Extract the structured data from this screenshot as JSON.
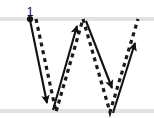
{
  "diagram": {
    "letter": "W",
    "background_color": "#ffffff",
    "guideline_color": "#e2e2e2",
    "stroke_color": "#111111",
    "outline_color": "#1a1a1a",
    "guidelines": [
      {
        "name": "top-guideline",
        "y": 19
      },
      {
        "name": "baseline-guideline",
        "y": 111
      }
    ],
    "start_marker": {
      "label": "1",
      "label_x": 30,
      "label_y": 16,
      "dot_x": 30,
      "dot_y": 19,
      "dot_radius": 3.1
    },
    "strokes": [
      {
        "order": 1,
        "name": "stroke-1-down-right",
        "from_x": 30,
        "from_y": 20,
        "to_x": 47,
        "to_y": 103,
        "direction": "down-right"
      },
      {
        "order": 2,
        "name": "stroke-2-up-right",
        "from_x": 53,
        "from_y": 110,
        "to_x": 77,
        "to_y": 26,
        "direction": "up-right"
      },
      {
        "order": 3,
        "name": "stroke-3-down-right",
        "from_x": 86,
        "from_y": 21,
        "to_x": 112,
        "to_y": 88,
        "direction": "down-right"
      },
      {
        "order": 4,
        "name": "stroke-4-up-right",
        "from_x": 113,
        "from_y": 113,
        "to_x": 135,
        "to_y": 43,
        "direction": "up-right"
      }
    ],
    "outline_path": "M 36,19 L 56,112 L 83,19 L 110,112 L 138,19",
    "outline_dash": "4 4",
    "outline_width": 3.2
  }
}
